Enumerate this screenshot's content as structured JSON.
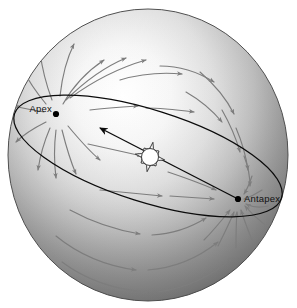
{
  "figure": {
    "width": 297,
    "height": 308,
    "background_color": "#ffffff"
  },
  "sphere": {
    "name": "celestial-sphere",
    "center_x": 148,
    "center_y": 155,
    "radius_x": 140,
    "radius_y": 146,
    "highlight_color": "#fbfbfb",
    "midtone_color": "#b8b8b8",
    "shadow_color": "#6f6f6f",
    "edge_color": "#4a4a4a"
  },
  "great_circle": {
    "name": "great-circle-of-apex-antapex",
    "stroke_color": "#0b0b0b",
    "center_x": 148,
    "center_y": 156,
    "radius_x": 140,
    "radius_y": 46,
    "rotation_deg": 17.5
  },
  "labels": {
    "apex": "Apex",
    "antapex": "Antapex"
  },
  "nodes": [
    {
      "id": "apex",
      "label": "Apex",
      "x": 56,
      "y": 114,
      "label_x": 22,
      "label_y": 112,
      "anchor": "end"
    },
    {
      "id": "antapex",
      "label": "Antapex",
      "x": 238,
      "y": 199,
      "label_x": 245,
      "label_y": 201,
      "anchor": "start"
    }
  ],
  "sun": {
    "name": "sun-symbol",
    "x": 150,
    "y": 157,
    "core_radius": 8.5,
    "ray_length": 15,
    "ray_count": 16,
    "fill_color": "#ffffff",
    "stroke_color": "#2a2a2a"
  },
  "solar_motion_vector": {
    "name": "solar-motion-vector",
    "from_x": 238,
    "from_y": 199,
    "to_x": 100,
    "to_y": 128,
    "direction": "toward-apex",
    "stroke_color": "#0b0b0b"
  },
  "motion_arrows": {
    "stroke_color": "#7d7d7d",
    "description": "Stellar parallactic motion: arrows diverge from the apex and converge on the antapex",
    "paths": [
      {
        "d": "M 63 104 C 72 88, 86 72, 104 60",
        "head_angle": -52
      },
      {
        "d": "M 66 100 C 82 84, 102 68, 126 58",
        "head_angle": -40
      },
      {
        "d": "M 70 98 C 92 82, 118 68, 146 60",
        "head_angle": -30
      },
      {
        "d": "M 60 96 C 62 78, 66 60, 74 44",
        "head_angle": -66
      },
      {
        "d": "M 52 100 C 46 84, 42 68, 40 52",
        "head_angle": -96
      },
      {
        "d": "M 46 104 C 36 92, 28 80, 22 68",
        "head_angle": -120
      },
      {
        "d": "M 44 112 C 32 110, 22 108, 14 106",
        "head_angle": -170
      },
      {
        "d": "M 46 122 C 34 128, 24 134, 16 142",
        "head_angle": 145
      },
      {
        "d": "M 50 128 C 44 142, 40 156, 38 170",
        "head_angle": 100
      },
      {
        "d": "M 56 130 C 54 146, 54 162, 56 178",
        "head_angle": 84
      },
      {
        "d": "M 62 130 C 66 146, 70 160, 76 174",
        "head_angle": 66
      },
      {
        "d": "M 68 126 C 78 138, 88 150, 100 160",
        "head_angle": 42
      },
      {
        "d": "M 90 110 C 106 108, 122 107, 138 106",
        "head_angle": -4
      },
      {
        "d": "M 146 108 C 162 108, 178 110, 194 112",
        "head_angle": 6
      },
      {
        "d": "M 120 80 C 140 74, 160 72, 182 74",
        "head_angle": -6
      },
      {
        "d": "M 160 66 C 180 66, 198 72, 214 82",
        "head_angle": 30
      },
      {
        "d": "M 186 92 C 200 100, 212 110, 222 122",
        "head_angle": 48
      },
      {
        "d": "M 200 72 C 214 84, 226 98, 234 114",
        "head_angle": 58
      },
      {
        "d": "M 222 110 C 230 124, 236 138, 240 152",
        "head_angle": 72
      },
      {
        "d": "M 236 128 C 242 142, 246 156, 248 170",
        "head_angle": 80
      },
      {
        "d": "M 244 156 C 248 166, 250 176, 250 186",
        "head_angle": 86
      },
      {
        "d": "M 252 176 C 250 182, 248 188, 244 194",
        "head_angle": 122
      },
      {
        "d": "M 262 190 C 256 194, 250 197, 244 199",
        "head_angle": 168
      },
      {
        "d": "M 268 206 C 260 208, 252 207, 246 204",
        "head_angle": 200
      },
      {
        "d": "M 264 224 C 256 218, 250 212, 245 206",
        "head_angle": 222
      },
      {
        "d": "M 252 240 C 248 230, 244 220, 241 210",
        "head_angle": 252
      },
      {
        "d": "M 236 248 C 236 236, 236 224, 237 212",
        "head_angle": 272
      },
      {
        "d": "M 218 246 C 224 234, 230 222, 234 212",
        "head_angle": 292
      },
      {
        "d": "M 204 240 C 214 230, 222 220, 230 210",
        "head_angle": 312
      },
      {
        "d": "M 100 190 C 120 192, 142 194, 162 196",
        "head_angle": 6
      },
      {
        "d": "M 170 196 C 186 197, 200 198, 214 199",
        "head_angle": 4
      },
      {
        "d": "M 70 210 C 92 222, 116 230, 140 234",
        "head_angle": 14
      },
      {
        "d": "M 152 235 C 172 234, 190 228, 206 218",
        "head_angle": -30
      },
      {
        "d": "M 56 236 C 78 254, 106 266, 136 270",
        "head_angle": 14
      },
      {
        "d": "M 148 270 C 174 268, 198 258, 218 242",
        "head_angle": -36
      },
      {
        "d": "M 62 262 C 86 280, 116 290, 148 292",
        "head_angle": 8
      },
      {
        "d": "M 158 292 C 186 288, 212 276, 232 258",
        "head_angle": -40
      },
      {
        "d": "M 88 144 C 106 148, 124 152, 142 156",
        "head_angle": 12
      },
      {
        "d": "M 168 172 C 186 178, 202 184, 216 190",
        "head_angle": 20
      }
    ]
  }
}
